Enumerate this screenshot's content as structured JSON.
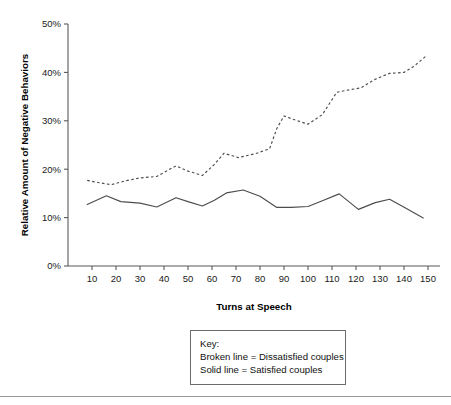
{
  "chart_data": {
    "type": "line",
    "title": "",
    "xlabel": "Turns at Speech",
    "ylabel": "Relative Amount of Negative Behaviors",
    "xlim": [
      0,
      155
    ],
    "ylim": [
      0,
      50
    ],
    "grid": false,
    "x_ticks": [
      10,
      20,
      30,
      40,
      50,
      60,
      70,
      80,
      90,
      100,
      110,
      120,
      130,
      140,
      150
    ],
    "x_tick_labels": [
      "10",
      "20",
      "30",
      "40",
      "50",
      "60",
      "70",
      "80",
      "90",
      "100",
      "110",
      "120",
      "130",
      "140",
      "150"
    ],
    "y_ticks": [
      0,
      10,
      20,
      30,
      40,
      50
    ],
    "y_tick_labels": [
      "0%",
      "10%",
      "20%",
      "30%",
      "40%",
      "50%"
    ],
    "legend_position": "below-center",
    "series": [
      {
        "name": "Dissatisfied couples",
        "style": "dashed",
        "color": "#4d4d4d",
        "x": [
          8,
          13,
          18,
          24,
          30,
          37,
          45,
          50,
          56,
          61,
          65,
          71,
          78,
          84,
          87,
          90,
          95,
          100,
          106,
          112,
          116,
          122,
          128,
          134,
          140,
          144,
          149
        ],
        "values": [
          17.7,
          17.2,
          16.8,
          17.6,
          18.2,
          18.5,
          20.7,
          19.6,
          18.7,
          21.0,
          23.3,
          22.4,
          23.2,
          24.2,
          28.4,
          31.0,
          30.1,
          29.3,
          31.3,
          35.9,
          36.3,
          36.8,
          38.6,
          39.8,
          40.0,
          41.2,
          43.3
        ]
      },
      {
        "name": "Satisfied couples",
        "style": "solid",
        "color": "#4d4d4d",
        "x": [
          8,
          16,
          22,
          30,
          37,
          45,
          50,
          56,
          61,
          66,
          73,
          80,
          87,
          93,
          100,
          106,
          113,
          121,
          128,
          134,
          141,
          148
        ],
        "values": [
          12.7,
          14.5,
          13.3,
          13.0,
          12.2,
          14.1,
          13.3,
          12.4,
          13.6,
          15.1,
          15.7,
          14.4,
          12.1,
          12.1,
          12.3,
          13.5,
          14.9,
          11.7,
          13.1,
          13.8,
          11.9,
          9.9
        ]
      }
    ]
  },
  "legend": {
    "title": "Key:",
    "entries": [
      "Broken line = Dissatisfied couples",
      "Solid line = Satisfied couples"
    ]
  }
}
